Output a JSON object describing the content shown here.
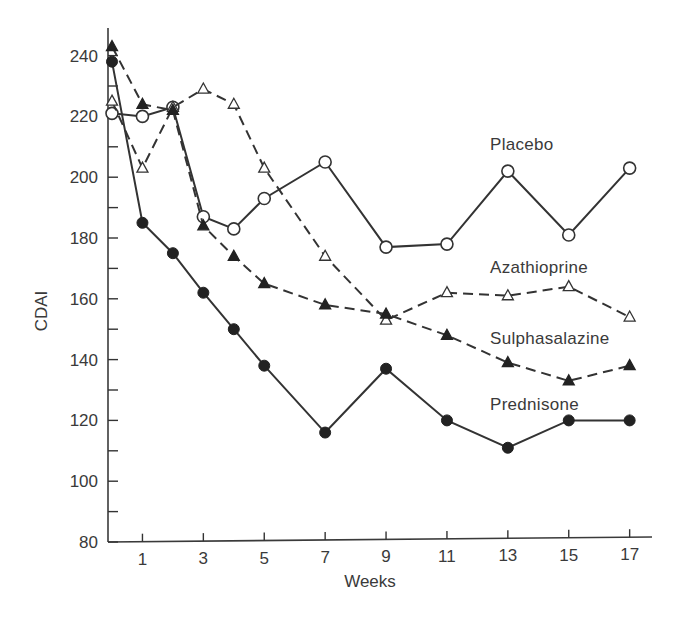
{
  "chart_data": {
    "type": "line",
    "title": "",
    "xlabel": "Weeks",
    "ylabel": "CDAI",
    "x_ticks": [
      1,
      3,
      5,
      7,
      9,
      11,
      13,
      15,
      17
    ],
    "y_ticks": [
      80,
      100,
      120,
      140,
      160,
      180,
      200,
      220,
      240
    ],
    "xlim": [
      0,
      17.5
    ],
    "ylim": [
      80,
      245
    ],
    "grid": false,
    "legend_position": "inline labels at right",
    "x": [
      0,
      1,
      2,
      3,
      4,
      5,
      7,
      9,
      11,
      13,
      15,
      17
    ],
    "series": [
      {
        "name": "Placebo",
        "marker": "open-circle",
        "line": "solid",
        "values": [
          221,
          220,
          223,
          187,
          183,
          193,
          205,
          177,
          178,
          202,
          181,
          203
        ]
      },
      {
        "name": "Azathioprine",
        "marker": "open-triangle",
        "line": "dashed",
        "values": [
          225,
          203,
          223,
          229,
          224,
          203,
          174,
          153,
          162,
          161,
          164,
          154
        ]
      },
      {
        "name": "Sulphasalazine",
        "marker": "filled-triangle",
        "line": "dashed",
        "values": [
          243,
          224,
          222,
          184,
          174,
          165,
          158,
          155,
          148,
          139,
          133,
          138
        ]
      },
      {
        "name": "Prednisone",
        "marker": "filled-circle",
        "line": "solid",
        "values": [
          238,
          185,
          175,
          162,
          150,
          138,
          116,
          137,
          120,
          111,
          120,
          120
        ]
      }
    ],
    "annotations": [
      {
        "text": "Placebo",
        "x_px": 490,
        "y_px": 150
      },
      {
        "text": "Azathioprine",
        "x_px": 490,
        "y_px": 273
      },
      {
        "text": "Sulphasalazine",
        "x_px": 490,
        "y_px": 344
      },
      {
        "text": "Prednisone",
        "x_px": 490,
        "y_px": 410
      }
    ]
  },
  "colors": {
    "ink": "#333333",
    "background": "#ffffff"
  }
}
